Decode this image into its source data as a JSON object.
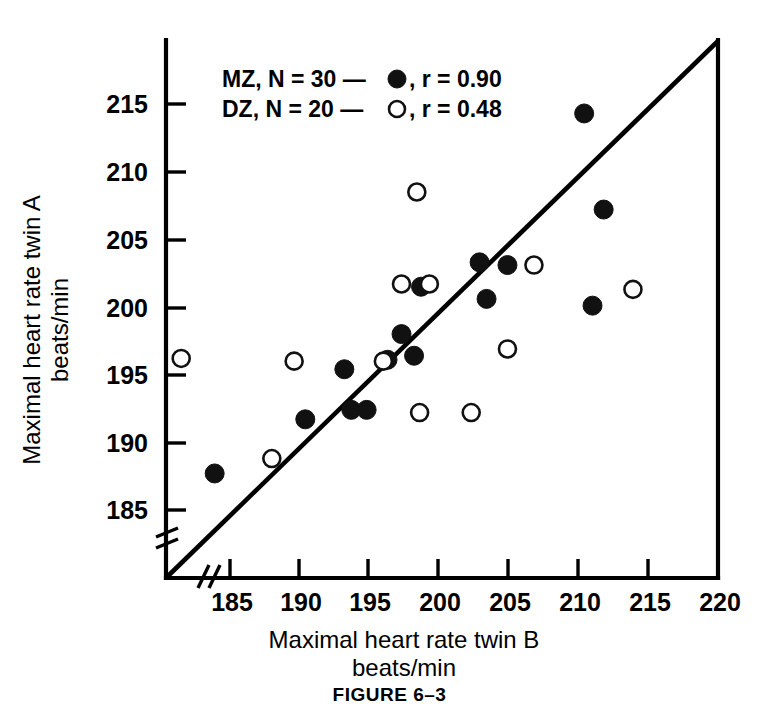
{
  "figure": {
    "caption": "FIGURE 6–3",
    "xlabel_line1": "Maximal heart rate twin B",
    "xlabel_line2": "beats/min",
    "ylabel_line1": "Maximal heart rate twin A",
    "ylabel_line2": "beats/min"
  },
  "legend": {
    "entries": [
      {
        "label_before": "MZ, N = 30 —",
        "marker": "filled-circle",
        "label_after": ", r = 0.90"
      },
      {
        "label_before": "DZ, N = 20 —",
        "marker": "open-circle",
        "label_after": ", r = 0.48"
      }
    ]
  },
  "chart_data": {
    "type": "scatter",
    "title": "",
    "xlabel": "Maximal heart rate twin B beats/min",
    "ylabel": "Maximal heart rate twin A beats/min",
    "xlim": [
      181.0,
      220.0
    ],
    "ylim": [
      182.5,
      218.5
    ],
    "xticks": [
      185,
      190,
      195,
      200,
      205,
      210,
      215,
      220
    ],
    "yticks": [
      185,
      190,
      195,
      200,
      205,
      210,
      215
    ],
    "xtick_labels": [
      "185",
      "190",
      "195",
      "200",
      "205",
      "210",
      "215",
      "220"
    ],
    "ytick_labels": [
      "185",
      "190",
      "195",
      "200",
      "205",
      "210",
      "215"
    ],
    "axis_break_x": true,
    "axis_break_y": true,
    "grid": false,
    "legend_position": "upper-left-inside",
    "reference_line": {
      "name": "identity-line",
      "x": [
        181.2,
        220.0
      ],
      "y": [
        182.6,
        218.5
      ]
    },
    "series": [
      {
        "name": "MZ",
        "n": 30,
        "r": 0.9,
        "marker": "filled-circle",
        "color": "#111111",
        "points": [
          [
            183.9,
            187.7
          ],
          [
            190.4,
            191.7
          ],
          [
            193.2,
            195.4
          ],
          [
            193.7,
            192.4
          ],
          [
            194.8,
            192.4
          ],
          [
            196.3,
            196.1
          ],
          [
            197.3,
            198.0
          ],
          [
            198.2,
            196.4
          ],
          [
            198.7,
            201.5
          ],
          [
            202.9,
            203.3
          ],
          [
            203.4,
            200.6
          ],
          [
            204.9,
            203.1
          ],
          [
            210.4,
            214.3
          ],
          [
            211.0,
            200.1
          ],
          [
            211.8,
            207.2
          ]
        ]
      },
      {
        "name": "DZ",
        "n": 20,
        "r": 0.48,
        "marker": "open-circle",
        "color": "#ffffff",
        "points": [
          [
            181.5,
            196.2
          ],
          [
            188.0,
            188.8
          ],
          [
            189.6,
            196.0
          ],
          [
            196.0,
            196.0
          ],
          [
            197.3,
            201.7
          ],
          [
            198.4,
            208.5
          ],
          [
            198.6,
            192.2
          ],
          [
            199.3,
            201.7
          ],
          [
            202.3,
            192.2
          ],
          [
            204.9,
            196.9
          ],
          [
            206.8,
            203.1
          ],
          [
            213.9,
            201.3
          ]
        ]
      }
    ]
  }
}
